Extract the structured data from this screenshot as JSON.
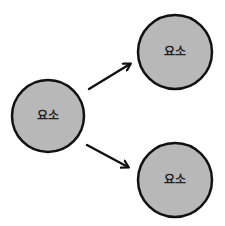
{
  "diagram": {
    "nodes": [
      {
        "id": "source",
        "label": "요소",
        "cx": 48,
        "cy": 116,
        "r": 36
      },
      {
        "id": "target-top",
        "label": "요소",
        "cx": 175,
        "cy": 52,
        "r": 37
      },
      {
        "id": "target-bottom",
        "label": "요소",
        "cx": 175,
        "cy": 180,
        "r": 37
      }
    ],
    "edges": [
      {
        "from": "source",
        "to": "target-top"
      },
      {
        "from": "source",
        "to": "target-bottom"
      }
    ],
    "colors": {
      "node_fill": "#b8b8b8",
      "node_stroke": "#111111",
      "arrow": "#111111",
      "background": "#ffffff"
    }
  }
}
